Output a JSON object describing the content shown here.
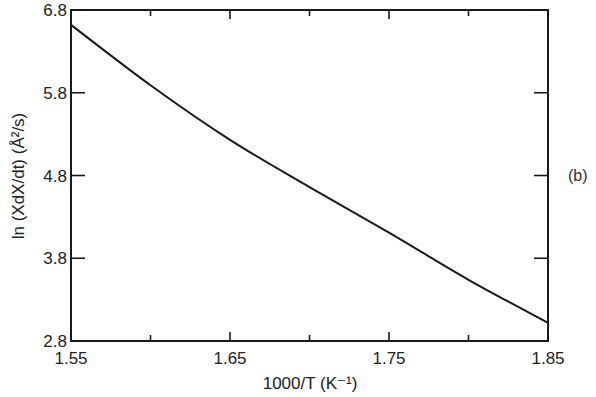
{
  "chart_data": {
    "type": "line",
    "title": "",
    "panel_label": "(b)",
    "xlabel": "1000/T   (K⁻¹)",
    "ylabel": "ln (XdX/dt) (Å²/s)",
    "xlim": [
      1.55,
      1.85
    ],
    "ylim": [
      2.8,
      6.8
    ],
    "x_ticks": [
      "1.55",
      "1.65",
      "1.75",
      "1.85"
    ],
    "x_minor_ticks": [
      1.6,
      1.7,
      1.8
    ],
    "y_ticks": [
      "2.8",
      "3.8",
      "4.8",
      "5.8",
      "6.8"
    ],
    "grid": false,
    "legend": null,
    "series": [
      {
        "name": "ln(XdX/dt)",
        "x": [
          1.55,
          1.6,
          1.65,
          1.7,
          1.75,
          1.8,
          1.85
        ],
        "values": [
          6.62,
          5.89,
          5.23,
          4.66,
          4.11,
          3.54,
          3.02
        ]
      }
    ]
  },
  "plot": {
    "frame": {
      "left": 71,
      "right": 548,
      "top": 10,
      "bottom": 341
    },
    "line_color": "#1a1a1a"
  }
}
